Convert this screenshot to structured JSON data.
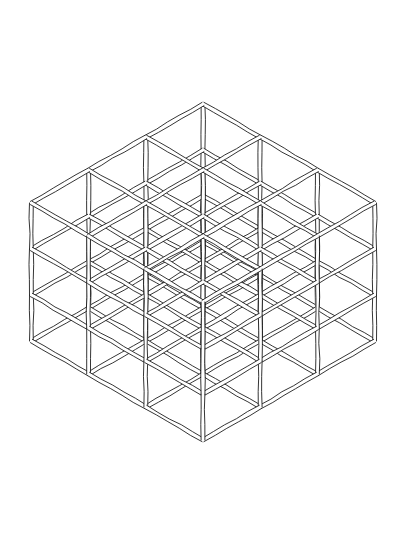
{
  "artwork": {
    "title": "Isometric Cube Lattice",
    "medium": "pen-and-ink line drawing",
    "background_color": "#ffffff",
    "ink_color": "#101010",
    "canvas": {
      "width": 399,
      "height": 547
    }
  },
  "geometry": {
    "type": "isometric-cubic-lattice",
    "divisions_per_axis": 3,
    "nodes_per_axis": 4,
    "total_nodes": 64,
    "silhouette": "hexagon",
    "center": {
      "x": 203,
      "y": 272
    },
    "apex_top": {
      "x": 203,
      "y": 32
    },
    "apex_bottom": {
      "x": 203,
      "y": 512
    },
    "left_edge_x": 32,
    "right_edge_x": 375,
    "axis_u": {
      "dx": 57.2,
      "dy": 33.0
    },
    "axis_v": {
      "dx": -57.2,
      "dy": 33.0
    },
    "axis_w": {
      "dx": 0,
      "dy": 46.0
    },
    "strut_directions": [
      "vertical",
      "diagonal-down-right",
      "diagonal-down-left"
    ],
    "beam_style": {
      "rendering": "double-outline beam",
      "half_width": 1.9,
      "stroke_width": 0.85,
      "wobble_amplitude": 0.55
    }
  },
  "labels": {
    "top_vertex": "top apex",
    "bottom_vertex": "bottom apex",
    "left_vertex": "left edge",
    "right_vertex": "right edge"
  }
}
